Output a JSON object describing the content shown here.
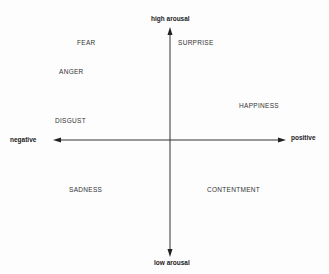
{
  "diagram": {
    "type": "circumplex-model-of-affect",
    "axes": {
      "vertical": {
        "top_label": "high arousal",
        "bottom_label": "low arousal"
      },
      "horizontal": {
        "left_label": "negative",
        "right_label": "positive"
      }
    },
    "emotions": [
      {
        "label": "FEAR",
        "quadrant": "negative-high"
      },
      {
        "label": "ANGER",
        "quadrant": "negative-high"
      },
      {
        "label": "DISGUST",
        "quadrant": "negative-high"
      },
      {
        "label": "SURPRISE",
        "quadrant": "positive-high"
      },
      {
        "label": "HAPPINESS",
        "quadrant": "positive-high"
      },
      {
        "label": "SADNESS",
        "quadrant": "negative-low"
      },
      {
        "label": "CONTENTMENT",
        "quadrant": "positive-low"
      }
    ],
    "colors": {
      "axis": "#333333",
      "text": "#333333",
      "background": "#fdfdfd"
    }
  }
}
